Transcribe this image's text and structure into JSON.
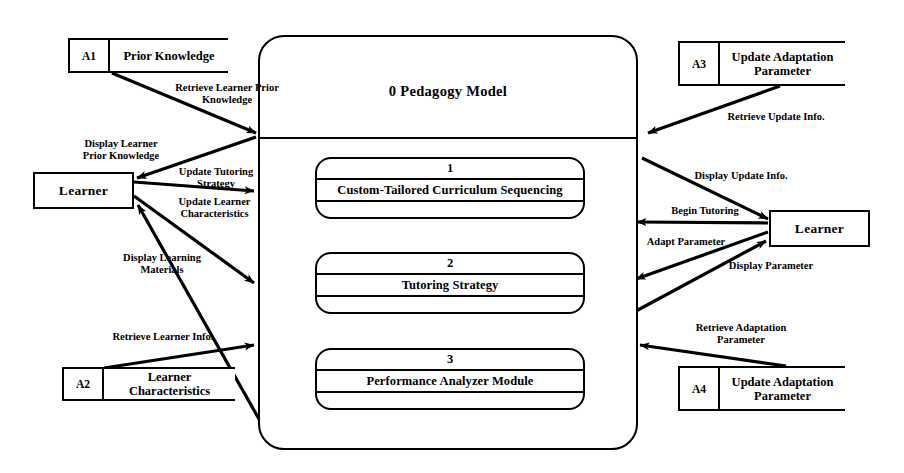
{
  "diagram": {
    "title": "0 Pedagogy Model",
    "type": "data-flow-diagram",
    "level": "Level 0 / Level 1 DFD"
  },
  "system": {
    "label": "0 Pedagogy Model"
  },
  "processes": [
    {
      "number": "1",
      "name": "Custom-Tailored Curriculum Sequencing"
    },
    {
      "number": "2",
      "name": "Tutoring Strategy"
    },
    {
      "number": "3",
      "name": "Performance Analyzer Module"
    }
  ],
  "data_stores": [
    {
      "id": "A1",
      "name": "Prior Knowledge"
    },
    {
      "id": "A2",
      "name": "Learner Characteristics"
    },
    {
      "id": "A3",
      "name": "Update Adaptation Parameter"
    },
    {
      "id": "A4",
      "name": "Update Adaptation Parameter"
    }
  ],
  "entities": [
    {
      "id": "learner-left",
      "name": "Learner"
    },
    {
      "id": "learner-right",
      "name": "Learner"
    }
  ],
  "flows": [
    {
      "id": "f1",
      "label": "Retrieve Learner Prior\nKnowledge"
    },
    {
      "id": "f2",
      "label": "Display Learner\nPrior Knowledge"
    },
    {
      "id": "f3",
      "label": "Update Tutoring\nStrategy"
    },
    {
      "id": "f4",
      "label": "Update Learner\nCharacteristics"
    },
    {
      "id": "f5",
      "label": "Display Learning\nMaterials"
    },
    {
      "id": "f6",
      "label": "Retrieve Learner Info."
    },
    {
      "id": "f7",
      "label": "Retrieve Update Info."
    },
    {
      "id": "f8",
      "label": "Display Update Info."
    },
    {
      "id": "f9",
      "label": "Begin Tutoring"
    },
    {
      "id": "f10",
      "label": "Adapt Parameter"
    },
    {
      "id": "f11",
      "label": "Display Parameter"
    },
    {
      "id": "f12",
      "label": "Retrieve Adaptation\nParameter"
    }
  ],
  "colors": {
    "stroke": "#000000",
    "background": "#ffffff"
  }
}
